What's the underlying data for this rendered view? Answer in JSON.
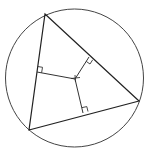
{
  "diagram": {
    "type": "geometry",
    "stroke_color": "#333333",
    "background": "#ffffff",
    "circle": {
      "cx": 74.5,
      "cy": 78,
      "r": 69
    },
    "triangle": {
      "vertices": [
        [
          45,
          14
        ],
        [
          139,
          101
        ],
        [
          29,
          130
        ]
      ]
    },
    "center_point": [
      75,
      79
    ],
    "perpendicular_feet": [
      [
        37,
        72
      ],
      [
        89,
        57
      ],
      [
        83,
        113
      ]
    ]
  }
}
